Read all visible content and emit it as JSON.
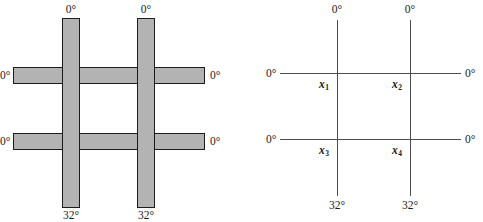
{
  "figure": {
    "type": "ply-layup-lattice-diagram",
    "panels": [
      {
        "id": "shaded-lattice",
        "name": "shaded lattice diagram",
        "style": "filled-bars",
        "fill_color": "#b3b3b3",
        "outline_color": "#1c1c1c",
        "labels": {
          "top_left": "0°",
          "top_right": "0°",
          "left_upper": "0°",
          "left_lower": "0°",
          "right_upper": "0°",
          "right_lower": "0°",
          "bottom_left": "32°",
          "bottom_right": "32°"
        }
      },
      {
        "id": "skeleton-lattice",
        "name": "line lattice diagram with labelled nodes",
        "style": "thin-lines",
        "line_color": "#4d4d4d",
        "labels": {
          "top_left": "0°",
          "top_right": "0°",
          "left_upper": "0°",
          "left_lower": "0°",
          "right_upper": "0°",
          "right_lower": "0°",
          "bottom_left": "32°",
          "bottom_right": "32°"
        },
        "nodes": [
          {
            "id": "n1",
            "label": "x",
            "subscript": "1",
            "position": "upper-left intersection"
          },
          {
            "id": "n2",
            "label": "x",
            "subscript": "2",
            "position": "upper-right intersection"
          },
          {
            "id": "n3",
            "label": "x",
            "subscript": "3",
            "position": "lower-left intersection"
          },
          {
            "id": "n4",
            "label": "x",
            "subscript": "4",
            "position": "lower-right intersection"
          }
        ]
      }
    ]
  }
}
